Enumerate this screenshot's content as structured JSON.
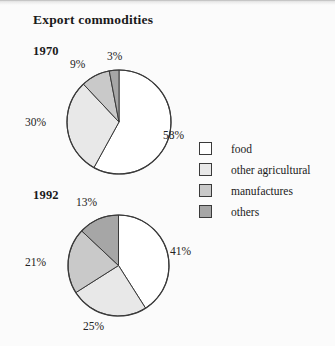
{
  "figure": {
    "title": "Export commodities",
    "background": "#fbfbfb",
    "stroke": "#3a3a3a"
  },
  "legend": {
    "position": "right",
    "entries": [
      {
        "label": "food",
        "color": "#ffffff"
      },
      {
        "label": "other agricultural",
        "color": "#e8e8e8"
      },
      {
        "label": "manufactures",
        "color": "#c9c9c9"
      },
      {
        "label": "others",
        "color": "#a6a6a6"
      }
    ]
  },
  "charts": [
    {
      "year": "1970",
      "labels": [
        "58%",
        "30%",
        "9%",
        "3%"
      ]
    },
    {
      "year": "1992",
      "labels": [
        "41%",
        "25%",
        "21%",
        "13%"
      ]
    }
  ],
  "chart_data": [
    {
      "type": "pie",
      "title": "1970",
      "categories": [
        "food",
        "other agricultural",
        "manufactures",
        "others"
      ],
      "values": [
        58,
        30,
        9,
        3
      ],
      "value_labels": [
        "58%",
        "30%",
        "9%",
        "3%"
      ],
      "colors": [
        "#ffffff",
        "#e8e8e8",
        "#c9c9c9",
        "#a6a6a6"
      ],
      "units": "percent",
      "start_angle_deg": 0,
      "direction": "clockwise",
      "legend": "right",
      "grid": false
    },
    {
      "type": "pie",
      "title": "1992",
      "categories": [
        "food",
        "other agricultural",
        "manufactures",
        "others"
      ],
      "values": [
        41,
        25,
        21,
        13
      ],
      "value_labels": [
        "41%",
        "25%",
        "21%",
        "13%"
      ],
      "colors": [
        "#ffffff",
        "#e8e8e8",
        "#c9c9c9",
        "#a6a6a6"
      ],
      "units": "percent",
      "start_angle_deg": 0,
      "direction": "clockwise",
      "legend": "right",
      "grid": false
    }
  ]
}
